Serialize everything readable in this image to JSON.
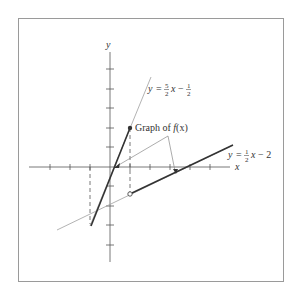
{
  "figure": {
    "frame": {
      "x": 18,
      "y": 18,
      "width": 265,
      "height": 263,
      "stroke": "#9a9a9a"
    },
    "axes": {
      "x_label": "x",
      "y_label": "y",
      "origin_px": [
        110,
        167
      ],
      "unit_px_x": 20,
      "unit_px_y": 19.5,
      "x_ticks": [
        -3,
        -2,
        -1,
        1,
        2,
        3,
        4,
        5
      ],
      "y_ticks": [
        -4,
        -3,
        -2,
        -1,
        1,
        2,
        3,
        4,
        5
      ],
      "color": "#555555"
    },
    "lines": [
      {
        "name": "line-a",
        "label_prefix": "y = ",
        "label_num": "5",
        "label_den": "2",
        "label_mid": "x − ",
        "label_num2": "1",
        "label_den2": "2",
        "label_suffix": "",
        "equation": "y = 5/2 x − 1/2",
        "color": "#9a9a9a"
      },
      {
        "name": "line-b",
        "label_prefix": "y = ",
        "label_num": "1",
        "label_den": "2",
        "label_mid": "x − 2",
        "equation": "y = 1/2 x − 2",
        "color": "#9a9a9a"
      }
    ],
    "callout": {
      "text_prefix": "Graph of ",
      "text_fn": "f",
      "text_suffix": "(x)"
    },
    "points": {
      "filled": {
        "x": 1,
        "y": 2
      },
      "hollow": {
        "x": 1,
        "y": -1.5
      }
    },
    "colors": {
      "heavy": "#333333",
      "light": "#a0a0a0",
      "dashed": "#555555"
    }
  }
}
